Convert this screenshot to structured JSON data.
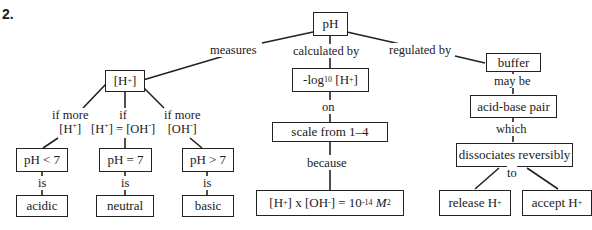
{
  "question_number": "2.",
  "nodes": {
    "ph": "pH",
    "h_ion": "[H+]",
    "neg_log": "-log10 [H+]",
    "scale": "scale from 1–4",
    "ion_product": "[H+] x [OH-] = 10-14 M2",
    "buffer": "buffer",
    "acid_base_pair": "acid-base pair",
    "dissociates": "dissociates reversibly",
    "release": "release H+",
    "accept": "accept H+",
    "ph_lt7": "pH < 7",
    "ph_eq7": "pH = 7",
    "ph_gt7": "pH > 7",
    "acidic": "acidic",
    "neutral": "neutral",
    "basic": "basic"
  },
  "links": {
    "measures": "measures",
    "calculated_by": "calculated by",
    "regulated_by": "regulated by",
    "on": "on",
    "because": "because",
    "may_be": "may be",
    "which": "which",
    "to": "to",
    "if_more_h": "if more [H+]",
    "if_equal": "if [H+] = [OH-]",
    "if_more_oh": "if more [OH-]",
    "is_1": "is",
    "is_2": "is",
    "is_3": "is"
  }
}
